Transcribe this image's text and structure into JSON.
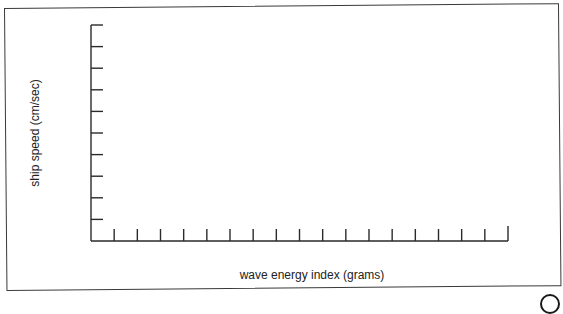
{
  "chart_data": {
    "type": "line",
    "title": "",
    "xlabel": "wave energy index (grams)",
    "ylabel": "ship speed (cm/sec)",
    "x_ticks": 18,
    "y_ticks": 9,
    "x_tick_labels": [],
    "y_tick_labels": [],
    "series": [],
    "grid": false,
    "legend": null,
    "note": "Blank axes template with unlabeled tick marks; no data plotted"
  },
  "colors": {
    "axis": "#2a2a2a",
    "frame": "#3a3a3a",
    "text": "#222222"
  }
}
